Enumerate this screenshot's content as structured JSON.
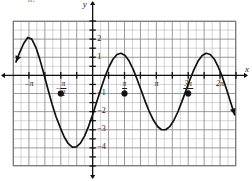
{
  "figure": {
    "corner_label": "d.",
    "axis_x_name": "x",
    "axis_y_name": "y"
  },
  "chart_data": {
    "type": "line",
    "title": "",
    "subtitle": "",
    "xlabel": "x",
    "ylabel": "y",
    "grid": true,
    "legend": "none",
    "xlim": [
      -3.9269908,
      7.0685835
    ],
    "ylim": [
      -5.0,
      3.0
    ],
    "x_unit": "pi",
    "x_tick_values": [
      -3.14159265,
      -1.57079633,
      1.57079633,
      3.14159265,
      4.71238898,
      6.28318531
    ],
    "x_tick_labels": [
      "-π",
      "-π/2",
      "π/2",
      "π",
      "3π/2",
      "2π"
    ],
    "x_tick_label_parts": [
      {
        "sign": "-",
        "whole": "π",
        "num": "",
        "den": ""
      },
      {
        "sign": "-",
        "whole": "",
        "num": "π",
        "den": "2"
      },
      {
        "sign": "",
        "whole": "",
        "num": "π",
        "den": "2"
      },
      {
        "sign": "",
        "whole": "π",
        "num": "",
        "den": ""
      },
      {
        "sign": "",
        "whole": "",
        "num": "3π",
        "den": "2"
      },
      {
        "sign": "",
        "whole": "2π",
        "num": "",
        "den": ""
      }
    ],
    "y_tick_values": [
      2,
      1,
      -1,
      -2,
      -3,
      -4
    ],
    "y_tick_labels": [
      "2",
      "1",
      "-1",
      "-2",
      "-3",
      "-4"
    ],
    "gridline_spacing_x": 0.39269908,
    "gridline_spacing_y": 0.5,
    "function": "y = -3 sin(2(x + pi/4)) - 1",
    "amplitude": 3,
    "midline": -1,
    "period": 3.14159265,
    "maximum": 2,
    "minimum": -4,
    "series": [
      {
        "name": "curve",
        "x": [
          -3.78,
          -3.6,
          -3.4,
          -3.2,
          -3.0,
          -2.8,
          -2.6,
          -2.4,
          -2.2,
          -2.0,
          -1.8,
          -1.6,
          -1.4,
          -1.2,
          -1.0,
          -0.8,
          -0.6,
          -0.4,
          -0.2,
          0.0,
          0.2,
          0.4,
          0.6,
          0.8,
          1.0,
          1.2,
          1.4,
          1.6,
          1.8,
          2.0,
          2.2,
          2.4,
          2.6,
          2.8,
          3.0,
          3.2,
          3.4,
          3.6,
          3.8,
          4.0,
          4.2,
          4.4,
          4.6,
          4.8,
          5.0,
          5.2,
          5.4,
          5.6,
          5.8,
          6.0,
          6.2,
          6.4,
          6.6,
          6.8,
          7.0
        ],
        "y": [
          0.74,
          1.26,
          1.76,
          2.09,
          2.0,
          1.55,
          0.87,
          0.06,
          -0.78,
          -1.59,
          -2.3,
          -2.87,
          -3.4,
          -3.77,
          -3.96,
          -3.95,
          -3.74,
          -3.35,
          -2.81,
          -2.17,
          -1.47,
          -0.76,
          -0.1,
          0.46,
          0.89,
          1.15,
          1.22,
          1.1,
          0.79,
          0.33,
          -0.24,
          -0.85,
          -1.46,
          -2.02,
          -2.48,
          -2.82,
          -3.0,
          -3.0,
          -2.83,
          -2.49,
          -2.02,
          -1.45,
          -0.84,
          -0.23,
          0.33,
          0.79,
          1.1,
          1.22,
          1.15,
          0.89,
          0.45,
          -0.1,
          -0.76,
          -1.47,
          -2.17
        ]
      }
    ],
    "marked_points": [
      {
        "x": -1.57079633,
        "y": -1,
        "label": ""
      },
      {
        "x": 1.57079633,
        "y": -1,
        "label": ""
      },
      {
        "x": 4.71238898,
        "y": -1,
        "label": ""
      }
    ],
    "arrow_start": {
      "x": -3.8,
      "y": 0.8
    },
    "arrow_end": {
      "x": 7.0,
      "y": -2.2
    },
    "annotations": []
  }
}
